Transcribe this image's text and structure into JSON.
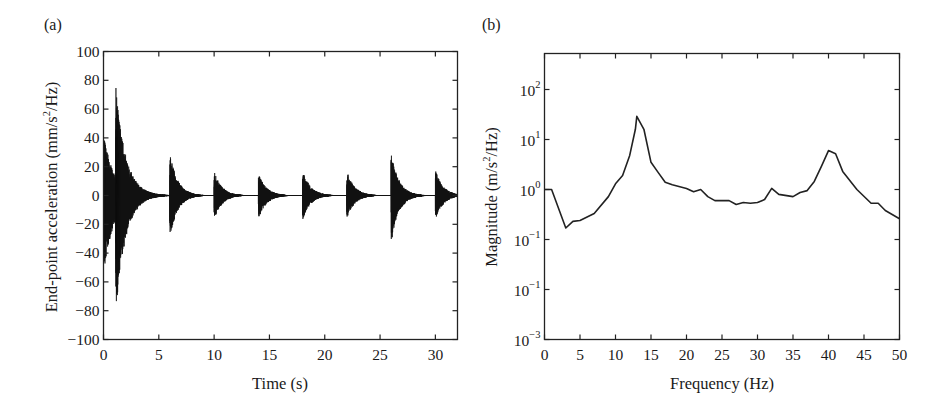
{
  "chart_data": [
    {
      "panel": "(a)",
      "type": "line",
      "title": "",
      "xlabel": "Time (s)",
      "ylabel": "End-point acceleration (mm/s²/Hz)",
      "ylabel_parts": {
        "pre": "End-point acceleration (mm/s",
        "sup": "2",
        "post": "/Hz)"
      },
      "xlim": [
        0,
        32
      ],
      "ylim": [
        -100,
        100
      ],
      "xticks": [
        0,
        5,
        10,
        15,
        20,
        25,
        30
      ],
      "yticks": [
        100,
        80,
        60,
        40,
        20,
        0,
        -20,
        -40,
        -60,
        -80,
        -100
      ],
      "ytick_labels": [
        "100",
        "80",
        "60",
        "40",
        "20",
        "0",
        "−20",
        "−40",
        "−60",
        "−80",
        "−100"
      ],
      "grid": false,
      "description": "Decaying impulse-response bursts (impact tests) sampled densely",
      "bursts": [
        {
          "t": 0.05,
          "pos_peak": 42,
          "neg_peak": -55,
          "decay_s": 0.9
        },
        {
          "t": 1.1,
          "pos_peak": 77,
          "neg_peak": -83,
          "decay_s": 0.9
        },
        {
          "t": 6.0,
          "pos_peak": 30,
          "neg_peak": -30,
          "decay_s": 0.7
        },
        {
          "t": 10.0,
          "pos_peak": 17,
          "neg_peak": -17,
          "decay_s": 0.7
        },
        {
          "t": 14.0,
          "pos_peak": 16,
          "neg_peak": -17,
          "decay_s": 0.7
        },
        {
          "t": 18.0,
          "pos_peak": 18,
          "neg_peak": -17,
          "decay_s": 0.7
        },
        {
          "t": 22.0,
          "pos_peak": 17,
          "neg_peak": -16,
          "decay_s": 0.7
        },
        {
          "t": 26.0,
          "pos_peak": 30,
          "neg_peak": -33,
          "decay_s": 0.7
        },
        {
          "t": 30.0,
          "pos_peak": 18,
          "neg_peak": -17,
          "decay_s": 0.7
        }
      ],
      "line_color": "#111111"
    },
    {
      "panel": "(b)",
      "type": "line",
      "title": "",
      "xlabel": "Frequency (Hz)",
      "ylabel": "Magnitude (m/s²/Hz)",
      "ylabel_parts": {
        "pre": "Magnitude (m/s",
        "sup": "2",
        "post": "/Hz)"
      },
      "yscale": "log",
      "xlim": [
        0,
        50
      ],
      "ylim": [
        0.001,
        525
      ],
      "xticks": [
        0,
        5,
        10,
        15,
        20,
        25,
        30,
        35,
        40,
        45,
        50
      ],
      "ytick_positions": [
        2,
        1,
        0,
        -1,
        -2,
        -3
      ],
      "ytick_labels": [
        {
          "base": "10",
          "exp": "2"
        },
        {
          "base": "10",
          "exp": "1"
        },
        {
          "base": "10",
          "exp": "0"
        },
        {
          "base": "10",
          "exp": "−1"
        },
        {
          "base": "10",
          "exp": "−1"
        },
        {
          "base": "10",
          "exp": "−3"
        }
      ],
      "grid": false,
      "x": [
        0,
        1,
        3,
        4,
        5,
        7,
        9,
        10,
        11,
        12,
        12.8,
        13,
        14,
        15,
        16,
        17,
        18,
        20,
        21,
        22,
        23,
        24,
        25,
        26,
        27,
        28,
        29,
        30,
        31,
        32,
        33,
        35,
        36,
        37,
        38,
        39,
        40,
        41,
        42,
        44,
        46,
        47,
        48,
        50
      ],
      "y": [
        1.0,
        1.0,
        0.17,
        0.23,
        0.24,
        0.33,
        0.72,
        1.3,
        1.9,
        4.8,
        16,
        29,
        16,
        3.5,
        2.2,
        1.4,
        1.25,
        1.05,
        0.9,
        1.0,
        0.72,
        0.6,
        0.6,
        0.6,
        0.5,
        0.55,
        0.53,
        0.55,
        0.63,
        1.05,
        0.8,
        0.72,
        0.87,
        0.95,
        1.45,
        2.9,
        6.0,
        5.2,
        2.3,
        1.0,
        0.53,
        0.53,
        0.38,
        0.26
      ],
      "peaks": [
        {
          "x": 13,
          "y": 29
        },
        {
          "x": 40,
          "y": 6.0
        }
      ],
      "line_color": "#222222"
    }
  ]
}
